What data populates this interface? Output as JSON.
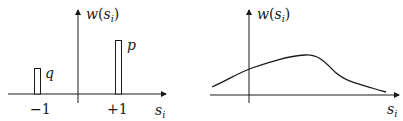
{
  "figure": {
    "left_panel": {
      "y_axis_label": "w",
      "y_axis_arg": "s",
      "y_axis_arg_sub": "i",
      "x_axis_label": "s",
      "x_axis_label_sub": "i",
      "ticks": [
        {
          "label": "−1",
          "value": -1
        },
        {
          "label": "+1",
          "value": 1
        }
      ],
      "bars": [
        {
          "label": "q",
          "position": -1,
          "height": 0.4
        },
        {
          "label": "p",
          "position": 1,
          "height": 0.8
        }
      ]
    },
    "right_panel": {
      "y_axis_label": "w",
      "y_axis_arg": "s",
      "y_axis_arg_sub": "i",
      "x_axis_label": "s",
      "x_axis_label_sub": "i",
      "curve": "smooth unimodal density, rising from left, peaking right of origin, decaying to the right"
    },
    "stroke_color": "#1a1a1a"
  }
}
